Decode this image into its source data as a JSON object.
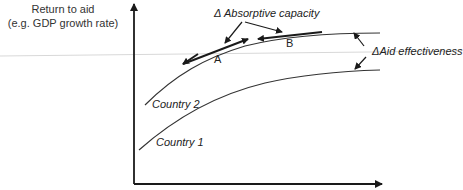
{
  "diagram": {
    "y_axis_label_line1": "Return to aid",
    "y_axis_label_line2": "(e.g. GDP growth rate)",
    "absorptive_capacity_label": "Δ Absorptive capacity",
    "aid_effectiveness_label": "ΔAid effectiveness",
    "point_a": "A",
    "point_b": "B",
    "country2_label": "Country 2",
    "country1_label": "Country 1",
    "colors": {
      "line": "#1a1a1a",
      "curve": "#333333",
      "guide": "#d8d8d8"
    }
  }
}
